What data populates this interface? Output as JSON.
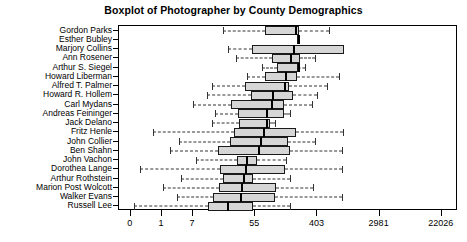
{
  "chart_data": {
    "type": "boxplot",
    "title": "Boxplot of Photographer by County Demographics",
    "xlabel": "",
    "ylabel": "",
    "orientation": "horizontal",
    "x_scale": "log",
    "grid": false,
    "legend": null,
    "xticks": [
      {
        "label": "0",
        "pos": 0
      },
      {
        "label": "1",
        "pos": 1
      },
      {
        "label": "7",
        "pos": 2
      },
      {
        "label": "55",
        "pos": 4
      },
      {
        "label": "403",
        "pos": 6
      },
      {
        "label": "2981",
        "pos": 8
      },
      {
        "label": "22026",
        "pos": 10
      }
    ],
    "xlim": [
      -0.38,
      10.52
    ],
    "categories": [
      "Gordon Parks",
      "Esther Bubley",
      "Marjory Collins",
      "Ann Rosener",
      "Arthur S. Siegel",
      "Howard Liberman",
      "Alfred T. Palmer",
      "Howard R. Hollem",
      "Carl Mydans",
      "Andreas Feininger",
      "Jack Delano",
      "Fritz Henle",
      "John Collier",
      "Ben Shahn",
      "John Vachon",
      "Dorothea Lange",
      "Arthur Rothstein",
      "Marion Post Wolcott",
      "Walker Evans",
      "Russell Lee"
    ],
    "boxes": [
      {
        "name": "Gordon Parks",
        "lower_whisker": 2.95,
        "q1": 4.32,
        "median": 5.28,
        "q3": 5.4,
        "upper_whisker": 6.37
      },
      {
        "name": "Esther Bubley",
        "lower_whisker": 5.33,
        "q1": 5.33,
        "median": 5.36,
        "q3": 5.43,
        "upper_whisker": 5.43
      },
      {
        "name": "Marjory Collins",
        "lower_whisker": 3.14,
        "q1": 3.9,
        "median": 5.22,
        "q3": 6.85,
        "upper_whisker": 6.85
      },
      {
        "name": "Ann Rosener",
        "lower_whisker": 3.37,
        "q1": 4.53,
        "median": 5.13,
        "q3": 5.43,
        "upper_whisker": 5.92
      },
      {
        "name": "Arthur S. Siegel",
        "lower_whisker": 4.22,
        "q1": 4.71,
        "median": 5.37,
        "q3": 5.39,
        "upper_whisker": 5.6
      },
      {
        "name": "Howard Liberman",
        "lower_whisker": 3.72,
        "q1": 4.3,
        "median": 4.95,
        "q3": 5.34,
        "upper_whisker": 6.7
      },
      {
        "name": "Alfred T. Palmer",
        "lower_whisker": 2.6,
        "q1": 3.68,
        "median": 4.91,
        "q3": 5.1,
        "upper_whisker": 6.3
      },
      {
        "name": "Howard R. Hollem",
        "lower_whisker": 2.46,
        "q1": 3.85,
        "median": 4.53,
        "q3": 5.23,
        "upper_whisker": 5.98
      },
      {
        "name": "Carl Mydans",
        "lower_whisker": 2.0,
        "q1": 3.23,
        "median": 4.52,
        "q3": 4.92,
        "upper_whisker": 5.82
      },
      {
        "name": "Andreas Feininger",
        "lower_whisker": 2.7,
        "q1": 3.46,
        "median": 4.36,
        "q3": 4.93,
        "upper_whisker": 5.12
      },
      {
        "name": "Jack Delano",
        "lower_whisker": 2.61,
        "q1": 3.47,
        "median": 4.35,
        "q3": 4.46,
        "upper_whisker": 4.63
      },
      {
        "name": "Fritz Henle",
        "lower_whisker": 0.72,
        "q1": 3.32,
        "median": 4.25,
        "q3": 5.31,
        "upper_whisker": 6.82
      },
      {
        "name": "John Collier",
        "lower_whisker": 1.54,
        "q1": 3.2,
        "median": 4.15,
        "q3": 5.05,
        "upper_whisker": 5.93
      },
      {
        "name": "Ben Shahn",
        "lower_whisker": 1.25,
        "q1": 2.8,
        "median": 4.1,
        "q3": 5.12,
        "upper_whisker": 6.8
      },
      {
        "name": "John Vachon",
        "lower_whisker": 2.08,
        "q1": 3.42,
        "median": 3.7,
        "q3": 4.05,
        "upper_whisker": 4.98
      },
      {
        "name": "Dorothea Lange",
        "lower_whisker": 0.3,
        "q1": 2.88,
        "median": 3.68,
        "q3": 4.95,
        "upper_whisker": 6.8
      },
      {
        "name": "Arthur Rothstein",
        "lower_whisker": 1.62,
        "q1": 2.95,
        "median": 3.62,
        "q3": 3.92,
        "upper_whisker": 5.12
      },
      {
        "name": "Marion Post Wolcott",
        "lower_whisker": 1.04,
        "q1": 2.83,
        "median": 3.55,
        "q3": 4.68,
        "upper_whisker": 5.85
      },
      {
        "name": "Walker Evans",
        "lower_whisker": 1.5,
        "q1": 2.65,
        "median": 3.52,
        "q3": 4.62,
        "upper_whisker": 6.8
      },
      {
        "name": "Russell Lee",
        "lower_whisker": 0.1,
        "q1": 2.47,
        "median": 3.1,
        "q3": 3.92,
        "upper_whisker": 5.12
      }
    ],
    "colors": {
      "box_fill": "#d6d6d6",
      "box_border": "#1a1a1a",
      "median": "#000000",
      "whisker": "#333333",
      "frame": "#000000",
      "background": "#ffffff",
      "text": "#000000"
    }
  }
}
